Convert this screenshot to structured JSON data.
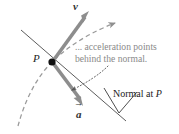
{
  "figure": {
    "background": "#ffffff",
    "width": 179,
    "height": 134,
    "colors": {
      "vector_gray": "#8d8d8d",
      "curve_gray": "#9a9a9a",
      "annotation_gray": "#8a8a8a",
      "line_black": "#3a3a3a",
      "point_black": "#111111"
    }
  },
  "labels": {
    "point_p": "P",
    "velocity_vector": "v",
    "acceleration_vector": "a",
    "callout_line1": "... acceleration points",
    "callout_line2": "behind the normal.",
    "normal_line_text": "Normal at ",
    "normal_line_point": "P"
  },
  "geometry": {
    "point_p": [
      52,
      62
    ],
    "velocity_tip": [
      89,
      11
    ],
    "acceleration_tip": [
      83,
      106
    ],
    "normal_start": [
      21,
      30
    ],
    "normal_end": [
      126,
      121
    ],
    "trajectory_arrow_tip": [
      120,
      22
    ]
  }
}
